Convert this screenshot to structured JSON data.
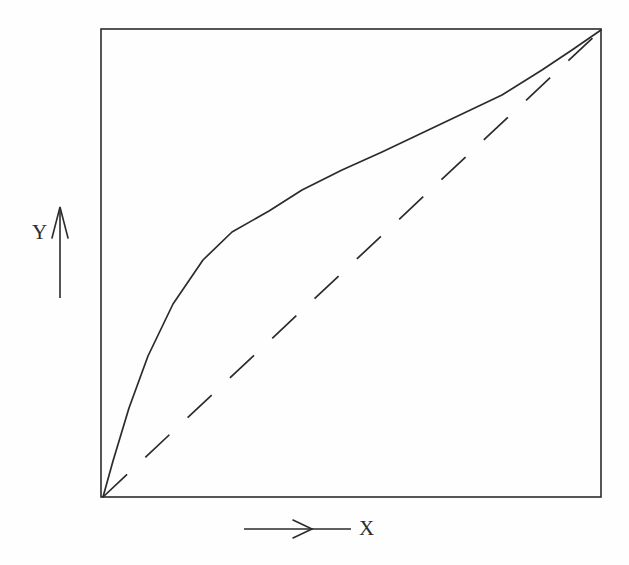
{
  "figure": {
    "background_color": "#fefefe",
    "ink_color": "#2b2b2b",
    "frame": {
      "x0": 101,
      "y0": 29,
      "x1": 601,
      "y1": 497,
      "stroke_width": 1.6
    }
  },
  "labels": {
    "y_axis": "Y",
    "x_axis": "X"
  },
  "annotations": {
    "y_arrow": {
      "name": "y-direction-arrow",
      "x": 60,
      "y_from": 298,
      "y_to": 208,
      "head": "up"
    },
    "x_arrow": {
      "name": "x-direction-arrow",
      "y": 529,
      "x_from": 244,
      "x_to": 351,
      "head_at_x": 309,
      "head": "right"
    }
  },
  "chart_data": {
    "type": "line",
    "title": "",
    "xlabel": "X",
    "ylabel": "Y",
    "grid": false,
    "legend": null,
    "axis_ticks": {
      "x": [],
      "y": []
    },
    "xlim": [
      0,
      1
    ],
    "ylim": [
      0,
      1
    ],
    "series": [
      {
        "name": "concave-curve",
        "style": "solid",
        "color": "#2b2b2b",
        "width": 1.7,
        "description": "Concave increasing curve rising steeply from origin then flattening toward the top-right corner",
        "x": [
          0.0,
          0.02,
          0.05,
          0.09,
          0.14,
          0.2,
          0.26,
          0.33,
          0.4,
          0.48,
          0.56,
          0.64,
          0.72,
          0.8,
          0.88,
          0.94,
          1.0
        ],
        "y": [
          0.0,
          0.08,
          0.19,
          0.3,
          0.41,
          0.51,
          0.58,
          0.64,
          0.7,
          0.75,
          0.79,
          0.83,
          0.87,
          0.91,
          0.95,
          0.97,
          1.0
        ],
        "pixel_points": [
          [
            103,
            497
          ],
          [
            113,
            461
          ],
          [
            129,
            408
          ],
          [
            148,
            356
          ],
          [
            173,
            304
          ],
          [
            203,
            260
          ],
          [
            232,
            232
          ],
          [
            269,
            211
          ],
          [
            302,
            190
          ],
          [
            342,
            170
          ],
          [
            382,
            152
          ],
          [
            422,
            133
          ],
          [
            462,
            114
          ],
          [
            502,
            95
          ],
          [
            542,
            70
          ],
          [
            572,
            50
          ],
          [
            601,
            30
          ]
        ]
      },
      {
        "name": "diagonal-reference",
        "style": "dashed",
        "color": "#2b2b2b",
        "width": 1.7,
        "dash_length": 33,
        "dash_gap": 25,
        "description": "Straight dashed diagonal line of equality from bottom-left origin to top-right corner",
        "x": [
          0,
          1
        ],
        "y": [
          0,
          1
        ],
        "pixel_points": [
          [
            103,
            497
          ],
          [
            601,
            30
          ]
        ]
      }
    ]
  }
}
